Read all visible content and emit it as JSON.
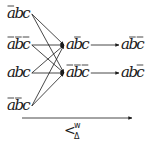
{
  "diagram": {
    "left_nodes": [
      {
        "id": "n1",
        "letters": [
          "a",
          "b",
          "c"
        ],
        "bars": [
          true,
          false,
          false
        ],
        "x": 7,
        "y": 18
      },
      {
        "id": "n2",
        "letters": [
          "a",
          "b",
          "c"
        ],
        "bars": [
          true,
          true,
          true
        ],
        "x": 7,
        "y": 49
      },
      {
        "id": "n3",
        "letters": [
          "a",
          "b",
          "c"
        ],
        "bars": [
          false,
          false,
          false
        ],
        "x": 7,
        "y": 77
      },
      {
        "id": "n4",
        "letters": [
          "a",
          "b",
          "c"
        ],
        "bars": [
          true,
          true,
          false
        ],
        "x": 7,
        "y": 110
      }
    ],
    "middle_nodes": [
      {
        "id": "m1",
        "letters": [
          "a",
          "b",
          "c"
        ],
        "bars": [
          false,
          true,
          false
        ],
        "x": 66,
        "y": 49
      },
      {
        "id": "m2",
        "letters": [
          "a",
          "b",
          "c"
        ],
        "bars": [
          true,
          true,
          true
        ],
        "x": 66,
        "y": 77
      }
    ],
    "right_nodes": [
      {
        "id": "r1",
        "letters": [
          "a",
          "b",
          "c"
        ],
        "bars": [
          false,
          true,
          true
        ],
        "x": 121,
        "y": 49
      },
      {
        "id": "r2",
        "letters": [
          "a",
          "b",
          "c"
        ],
        "bars": [
          false,
          false,
          true
        ],
        "x": 121,
        "y": 77
      }
    ],
    "edges": [
      {
        "from": "n1",
        "to": "m1"
      },
      {
        "from": "n1",
        "to": "m2"
      },
      {
        "from": "n2",
        "to": "m1"
      },
      {
        "from": "n2",
        "to": "m2"
      },
      {
        "from": "n3",
        "to": "m1"
      },
      {
        "from": "n3",
        "to": "m2"
      },
      {
        "from": "n4",
        "to": "m1"
      },
      {
        "from": "n4",
        "to": "m2"
      },
      {
        "from": "m1",
        "to": "r1"
      },
      {
        "from": "m2",
        "to": "r2"
      }
    ],
    "axis_arrow": {
      "label_main": "<",
      "label_sup": "w",
      "label_sub": "Δ"
    }
  }
}
